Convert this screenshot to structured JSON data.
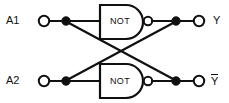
{
  "diagram": {
    "background_color": "#ffffff",
    "line_color": "#101010",
    "inputs": [
      {
        "id": "a1",
        "label": "A1",
        "terminal_x": 44,
        "terminal_y": 21,
        "junction_x": 66,
        "junction_y": 21
      },
      {
        "id": "a2",
        "label": "A2",
        "terminal_x": 44,
        "terminal_y": 81,
        "junction_x": 66,
        "junction_y": 81
      }
    ],
    "gates": [
      {
        "id": "gate-top",
        "label": "NOT",
        "type": "inverter",
        "x": 100,
        "y": 5,
        "width": 44,
        "height": 34,
        "bubble_x": 148,
        "bubble_y": 21
      },
      {
        "id": "gate-bottom",
        "label": "NOT",
        "type": "inverter",
        "x": 100,
        "y": 64,
        "width": 44,
        "height": 34,
        "bubble_x": 148,
        "bubble_y": 81
      }
    ],
    "outputs": [
      {
        "id": "y",
        "label": "Y",
        "overbar": false,
        "junction_x": 176,
        "junction_y": 21,
        "terminal_x": 199,
        "terminal_y": 21
      },
      {
        "id": "ybar",
        "label": "Y",
        "overbar": true,
        "junction_x": 176,
        "junction_y": 81,
        "terminal_x": 199,
        "terminal_y": 81
      }
    ],
    "cross_connections": [
      {
        "from": "a1-junction",
        "to": "ybar-junction",
        "style": "diagonal"
      },
      {
        "from": "a2-junction",
        "to": "y-junction",
        "style": "diagonal"
      }
    ]
  }
}
